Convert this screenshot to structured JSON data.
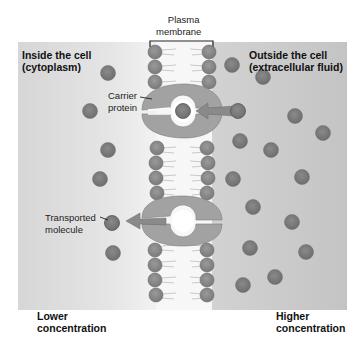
{
  "labels": {
    "membrane_line1": "Plasma",
    "membrane_line2": "membrane",
    "inside_line1": "Inside the cell",
    "inside_line2": "(cytoplasm)",
    "outside_line1": "Outside the cell",
    "outside_line2": "(extracellular fluid)",
    "carrier_line1": "Carrier",
    "carrier_line2": "protein",
    "transported_line1": "Transported",
    "transported_line2": "molecule",
    "lower_line1": "Lower",
    "lower_line2": "concentration",
    "higher_line1": "Higher",
    "higher_line2": "concentration"
  },
  "colors": {
    "background_left": "#dedede",
    "background_right": "#c9c9c9",
    "membrane_core": "#f6f6f6",
    "phospholipid_head": "#8e8e8e",
    "carrier_protein": "#a0a0a0",
    "molecule": "#7f7f7f",
    "arrow": "#8a8a8a"
  },
  "molecules_inside": [
    {
      "x": 108,
      "y": 73
    },
    {
      "x": 90,
      "y": 111
    },
    {
      "x": 108,
      "y": 150
    },
    {
      "x": 100,
      "y": 179
    },
    {
      "x": 113,
      "y": 253
    }
  ],
  "molecules_outside": [
    {
      "x": 236,
      "y": 66
    },
    {
      "x": 263,
      "y": 77
    },
    {
      "x": 295,
      "y": 119
    },
    {
      "x": 323,
      "y": 134
    },
    {
      "x": 240,
      "y": 145
    },
    {
      "x": 270,
      "y": 152
    },
    {
      "x": 301,
      "y": 176
    },
    {
      "x": 233,
      "y": 178
    },
    {
      "x": 254,
      "y": 208
    },
    {
      "x": 292,
      "y": 223
    },
    {
      "x": 249,
      "y": 249
    },
    {
      "x": 306,
      "y": 251
    },
    {
      "x": 275,
      "y": 276
    },
    {
      "x": 243,
      "y": 285
    }
  ]
}
